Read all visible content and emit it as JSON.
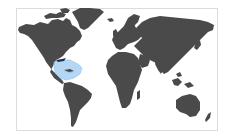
{
  "map": {
    "type": "world-map",
    "land_color": "#4a4a4a",
    "ocean_color": "#ffffff",
    "border_color": "#dcdcdc",
    "highlight": {
      "region": "Gulf of Mexico and Caribbean",
      "fill": "#a9d0f2",
      "stroke": "#8fc0ea"
    },
    "coastal_accent_color": "#1f2f5a"
  }
}
